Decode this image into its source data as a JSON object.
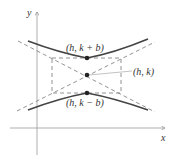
{
  "diagram": {
    "type": "hyperbola-vertical-transverse-axis",
    "axes": {
      "x_label": "x",
      "y_label": "y"
    },
    "points": [
      {
        "name": "upper-vertex",
        "label": "(h, k + b)"
      },
      {
        "name": "center",
        "label": "(h, k)"
      },
      {
        "name": "lower-vertex",
        "label": "(h, k − b)"
      }
    ],
    "elements": [
      "hyperbola branches",
      "asymptotes (dashed)",
      "central rectangle (dashed)"
    ],
    "colors": {
      "curve": "#444444",
      "dashed": "#666666",
      "axis": "#888888",
      "text": "#333333"
    }
  }
}
